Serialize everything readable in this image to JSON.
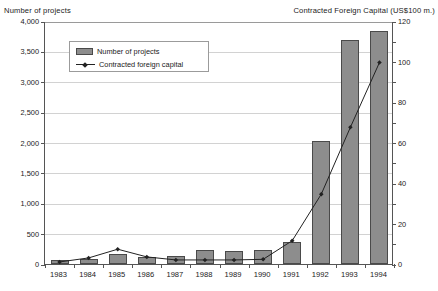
{
  "chart_data": {
    "type": "bar",
    "title": "",
    "categories": [
      "1983",
      "1984",
      "1985",
      "1986",
      "1987",
      "1988",
      "1989",
      "1990",
      "1991",
      "1992",
      "1993",
      "1994"
    ],
    "xlabel": "",
    "ylabel": "Number of projects",
    "y2label": "Contracted Foreign Capital (US$100 m.)",
    "ylim": [
      0,
      4000
    ],
    "y2lim": [
      0,
      120
    ],
    "ytick_labels": [
      "0",
      "500",
      "1,000",
      "1,500",
      "2,000",
      "2,500",
      "3,000",
      "3,500",
      "4,000"
    ],
    "ytick_values": [
      0,
      500,
      1000,
      1500,
      2000,
      2500,
      3000,
      3500,
      4000
    ],
    "y2tick_labels": [
      "0",
      "20",
      "40",
      "60",
      "80",
      "100",
      "120"
    ],
    "y2tick_values": [
      0,
      20,
      40,
      60,
      80,
      100,
      120
    ],
    "grid": true,
    "legend_position": "upper-left-inset",
    "series": [
      {
        "name": "Number of projects",
        "kind": "bar",
        "axis": "left",
        "color": "#8d8d8d",
        "values": [
          60,
          80,
          160,
          120,
          130,
          230,
          220,
          225,
          370,
          2030,
          3680,
          3830
        ]
      },
      {
        "name": "Contracted foreign capital",
        "kind": "line",
        "axis": "right",
        "color": "#222222",
        "values": [
          1.5,
          3.5,
          7.8,
          4.0,
          2.5,
          2.5,
          2.5,
          2.8,
          12.0,
          35.0,
          68.0,
          100.0
        ]
      }
    ]
  },
  "legend": {
    "items": [
      {
        "label": "Number of projects",
        "marker": "bar-swatch"
      },
      {
        "label": "Contracted foreign capital",
        "marker": "line-marker"
      }
    ]
  },
  "icons": {
    "bar_swatch": "bar-swatch-icon",
    "line_marker": "line-marker-icon"
  }
}
